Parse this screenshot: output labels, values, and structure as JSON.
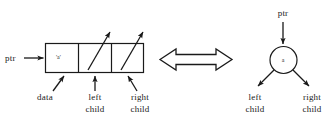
{
  "figure": {
    "background_color": "#ffffff",
    "stroke_color": "#1a1a1a"
  },
  "box_representation": {
    "pointer_label": "ptr",
    "cells": [
      {
        "name": "data",
        "value": "'a'",
        "caption": "data"
      },
      {
        "name": "left-child",
        "value": "",
        "caption_line1": "left",
        "caption_line2": "child"
      },
      {
        "name": "right-child",
        "value": "",
        "caption_line1": "right",
        "caption_line2": "child"
      }
    ]
  },
  "equivalence": {
    "symbol_name": "double-headed-arrow",
    "direction": "left-right"
  },
  "tree_representation": {
    "pointer_label": "ptr",
    "node_value": "a",
    "left_caption_line1": "left",
    "left_caption_line2": "child",
    "right_caption_line1": "right",
    "right_caption_line2": "child"
  }
}
